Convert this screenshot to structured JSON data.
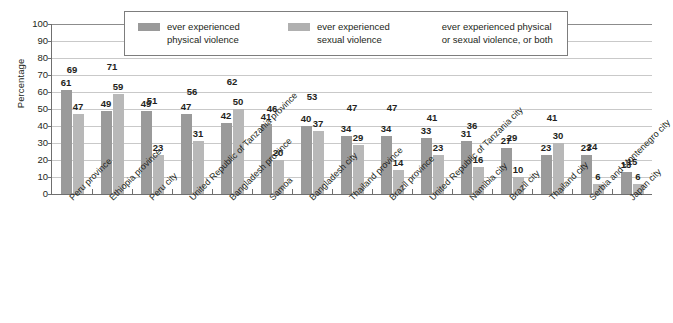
{
  "chart_data": {
    "type": "bar",
    "title": "",
    "xlabel": "",
    "ylabel": "Percentage",
    "ylim": [
      0,
      100
    ],
    "yticks": [
      0,
      10,
      20,
      30,
      40,
      50,
      60,
      70,
      80,
      90,
      100
    ],
    "grid": true,
    "legend_position": "top",
    "categories": [
      "Peru province",
      "Ethiopia province",
      "Peru city",
      "United Republic of Tanzania province",
      "Bangladesh province",
      "Samoa",
      "Bangladesh city",
      "Thailand province",
      "Brazil province",
      "United Republic of Tanzania city",
      "Namibia city",
      "Brazil city",
      "Thailand city",
      "Serbia and Montenegro city",
      "Japan city"
    ],
    "series": [
      {
        "name": "ever experienced physical violence",
        "color": "#9a9a9a",
        "values": [
          61,
          49,
          49,
          47,
          42,
          41,
          40,
          34,
          34,
          33,
          31,
          27,
          23,
          23,
          13
        ]
      },
      {
        "name": "ever experienced sexual violence",
        "color": "#b8b8b8",
        "values": [
          47,
          59,
          23,
          31,
          50,
          20,
          37,
          29,
          14,
          23,
          16,
          10,
          30,
          6,
          6
        ]
      },
      {
        "name": "ever experienced physical or sexual violence, or both",
        "color": "",
        "values": [
          69,
          71,
          51,
          56,
          62,
          46,
          53,
          47,
          47,
          41,
          36,
          29,
          41,
          24,
          15
        ]
      }
    ]
  },
  "legend": {
    "items": [
      {
        "line1": "ever experienced",
        "line2": "physical violence",
        "has_swatch": true
      },
      {
        "line1": "ever experienced",
        "line2": "sexual violence",
        "has_swatch": true
      },
      {
        "line1": "ever experienced physical",
        "line2": "or sexual violence, or both",
        "has_swatch": false
      }
    ]
  },
  "axis": {
    "y_title": "Percentage"
  }
}
